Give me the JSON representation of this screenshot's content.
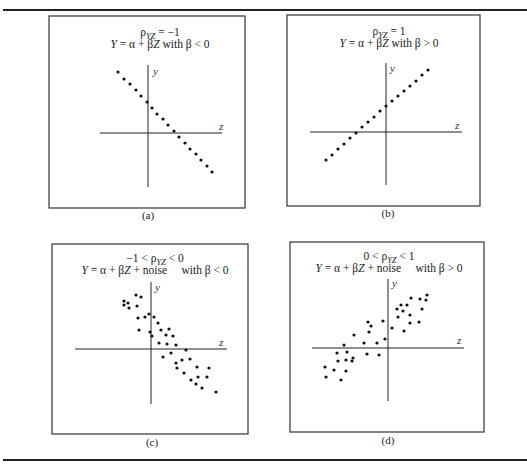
{
  "chart_data": [
    {
      "type": "scatter",
      "panel": "a",
      "caption": "(a)",
      "title_line1": "ρYZ = −1",
      "title_line2": "Y = α + βZ with β < 0",
      "xlabel": "z",
      "ylabel": "y",
      "box": {
        "x": 49,
        "y": 16,
        "w": 196,
        "h": 192
      },
      "axes": {
        "x0": 100,
        "x1": 222,
        "y0": 65,
        "y1": 187,
        "ox": 148,
        "oy": 133
      },
      "label_pos": {
        "y": [
          153,
          75
        ],
        "z": [
          219,
          130
        ]
      },
      "title_pos": {
        "cx": 160,
        "y1": 36,
        "y2": 48
      },
      "caption_pos": {
        "cx": 148,
        "y": 219
      },
      "points": [
        [
          118,
          72
        ],
        [
          124,
          79
        ],
        [
          130,
          84
        ],
        [
          136,
          90
        ],
        [
          141,
          96
        ],
        [
          147,
          102
        ],
        [
          152,
          108
        ],
        [
          157,
          114
        ],
        [
          163,
          119
        ],
        [
          168,
          125
        ],
        [
          174,
          131
        ],
        [
          179,
          137
        ],
        [
          185,
          143
        ],
        [
          190,
          149
        ],
        [
          196,
          154
        ],
        [
          201,
          160
        ],
        [
          207,
          166
        ],
        [
          212,
          172
        ]
      ]
    },
    {
      "type": "scatter",
      "panel": "b",
      "caption": "(b)",
      "title_line1": "ρYZ = 1",
      "title_line2": "Y = α + βZ with β > 0",
      "xlabel": "z",
      "ylabel": "y",
      "box": {
        "x": 287,
        "y": 15,
        "w": 193,
        "h": 191
      },
      "axes": {
        "x0": 310,
        "x1": 462,
        "y0": 63,
        "y1": 185,
        "ox": 386,
        "oy": 132
      },
      "label_pos": {
        "y": [
          390,
          72
        ],
        "z": [
          455,
          129
        ]
      },
      "title_pos": {
        "cx": 389,
        "y1": 35,
        "y2": 47
      },
      "caption_pos": {
        "cx": 388,
        "y": 217
      },
      "points": [
        [
          326,
          160
        ],
        [
          332,
          155
        ],
        [
          338,
          149
        ],
        [
          344,
          144
        ],
        [
          350,
          138
        ],
        [
          356,
          133
        ],
        [
          362,
          127
        ],
        [
          368,
          122
        ],
        [
          374,
          117
        ],
        [
          380,
          111
        ],
        [
          386,
          106
        ],
        [
          392,
          101
        ],
        [
          398,
          96
        ],
        [
          404,
          91
        ],
        [
          410,
          86
        ],
        [
          416,
          81
        ],
        [
          422,
          75
        ],
        [
          428,
          70
        ]
      ]
    },
    {
      "type": "scatter",
      "panel": "c",
      "caption": "(c)",
      "title_line1": "−1 < ρYZ < 0",
      "title_line2": "Y = α + βZ + noise     with β < 0",
      "xlabel": "z",
      "ylabel": "y",
      "box": {
        "x": 52,
        "y": 244,
        "w": 196,
        "h": 190
      },
      "axes": {
        "x0": 75,
        "x1": 227,
        "y0": 282,
        "y1": 404,
        "ox": 151,
        "oy": 349
      },
      "label_pos": {
        "y": [
          155,
          291
        ],
        "z": [
          219,
          346
        ]
      },
      "title_pos": {
        "cx": 155,
        "y1": 262,
        "y2": 274
      },
      "caption_pos": {
        "cx": 152,
        "y": 446
      },
      "points": [
        [
          136,
          295
        ],
        [
          141,
          297
        ],
        [
          124,
          301
        ],
        [
          128,
          303
        ],
        [
          124,
          305
        ],
        [
          129,
          308
        ],
        [
          137,
          306
        ],
        [
          149,
          314
        ],
        [
          145,
          317
        ],
        [
          154,
          317
        ],
        [
          138,
          318
        ],
        [
          158,
          323
        ],
        [
          139,
          330
        ],
        [
          161,
          330
        ],
        [
          169,
          329
        ],
        [
          150,
          332
        ],
        [
          166,
          335
        ],
        [
          173,
          336
        ],
        [
          152,
          336
        ],
        [
          159,
          343
        ],
        [
          167,
          344
        ],
        [
          176,
          345
        ],
        [
          186,
          350
        ],
        [
          171,
          353
        ],
        [
          163,
          357
        ],
        [
          182,
          360
        ],
        [
          190,
          359
        ],
        [
          176,
          363
        ],
        [
          177,
          368
        ],
        [
          197,
          367
        ],
        [
          209,
          368
        ],
        [
          184,
          373
        ],
        [
          198,
          377
        ],
        [
          207,
          377
        ],
        [
          191,
          380
        ],
        [
          196,
          384
        ],
        [
          202,
          388
        ],
        [
          216,
          392
        ]
      ]
    },
    {
      "type": "scatter",
      "panel": "d",
      "caption": "(d)",
      "title_line1": "0 < ρYZ < 1",
      "title_line2": "Y = α + βZ + noise     with β > 0",
      "xlabel": "z",
      "ylabel": "y",
      "box": {
        "x": 290,
        "y": 242,
        "w": 194,
        "h": 190
      },
      "axes": {
        "x0": 312,
        "x1": 464,
        "y0": 279,
        "y1": 401,
        "ox": 388,
        "oy": 348
      },
      "label_pos": {
        "y": [
          392,
          287
        ],
        "z": [
          457,
          344
        ]
      },
      "title_pos": {
        "cx": 389,
        "y1": 260,
        "y2": 272
      },
      "caption_pos": {
        "cx": 388,
        "y": 444
      },
      "points": [
        [
          427,
          295
        ],
        [
          411,
          298
        ],
        [
          420,
          299
        ],
        [
          426,
          300
        ],
        [
          401,
          305
        ],
        [
          407,
          305
        ],
        [
          397,
          309
        ],
        [
          403,
          311
        ],
        [
          422,
          309
        ],
        [
          410,
          315
        ],
        [
          398,
          317
        ],
        [
          383,
          321
        ],
        [
          368,
          322
        ],
        [
          419,
          322
        ],
        [
          371,
          326
        ],
        [
          410,
          323
        ],
        [
          392,
          328
        ],
        [
          404,
          331
        ],
        [
          369,
          332
        ],
        [
          354,
          335
        ],
        [
          385,
          339
        ],
        [
          364,
          343
        ],
        [
          377,
          343
        ],
        [
          344,
          345
        ],
        [
          337,
          353
        ],
        [
          347,
          352
        ],
        [
          367,
          354
        ],
        [
          379,
          355
        ],
        [
          353,
          358
        ],
        [
          338,
          361
        ],
        [
          346,
          360
        ],
        [
          352,
          361
        ],
        [
          325,
          367
        ],
        [
          334,
          370
        ],
        [
          346,
          371
        ],
        [
          326,
          377
        ],
        [
          341,
          380
        ]
      ]
    }
  ],
  "rules": {
    "top_y": 10,
    "bottom_y": 460,
    "x0": 3,
    "x1": 527
  }
}
